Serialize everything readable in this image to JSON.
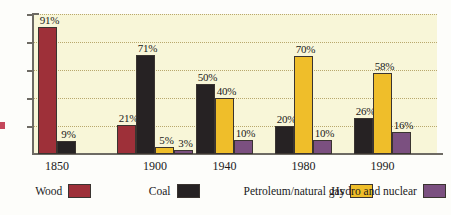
{
  "chart_data": {
    "type": "bar",
    "title": "",
    "subtitle": "",
    "xlabel": "",
    "ylabel": "",
    "ylim": [
      0,
      100
    ],
    "grid": true,
    "gridlines": [
      20,
      40,
      60,
      80,
      100
    ],
    "axis_tick_labels": [],
    "legend_position": "bottom",
    "categories": [
      "1850",
      "1900",
      "1940",
      "1980",
      "1990"
    ],
    "series": [
      {
        "name": "Wood",
        "color": "#9E3039",
        "values": [
          91,
          21,
          null,
          null,
          null
        ],
        "labels": [
          "91%",
          "21%",
          "",
          "",
          ""
        ]
      },
      {
        "name": "Coal",
        "color": "#262223",
        "values": [
          9,
          71,
          50,
          20,
          26
        ],
        "labels": [
          "9%",
          "71%",
          "50%",
          "20%",
          "26%"
        ]
      },
      {
        "name": "Petroleum/natural gas",
        "color": "#EFBE2A",
        "values": [
          null,
          5,
          40,
          70,
          58
        ],
        "labels": [
          "",
          "5%",
          "40%",
          "70%",
          "58%"
        ]
      },
      {
        "name": "Hydro and nuclear",
        "color": "#7B5080",
        "values": [
          null,
          3,
          10,
          10,
          16
        ],
        "labels": [
          "",
          "3%",
          "10%",
          "10%",
          "16%"
        ]
      }
    ]
  },
  "legend": {
    "items": [
      {
        "label": "Wood",
        "color": "#9E3039"
      },
      {
        "label": "Coal",
        "color": "#262223"
      },
      {
        "label": "Petroleum/natural gas",
        "color": "#EFBE2A"
      },
      {
        "label": "Hydro and nuclear",
        "color": "#7B5080"
      }
    ]
  },
  "colors": {
    "plot_background": "#f8f6d8",
    "page_background": "#fdfdfa",
    "gridline": "#b9a86c",
    "axis": "#6d6a63",
    "bar_outline": "#3a3430",
    "text": "#1a1a1a"
  }
}
